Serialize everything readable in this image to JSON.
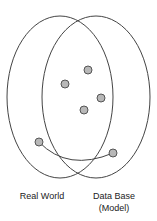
{
  "diagram": {
    "sets": [
      {
        "id": "real-world",
        "label": "Real World"
      },
      {
        "id": "data-base",
        "label": "Data Base",
        "sublabel": "(Model)"
      }
    ],
    "points": [
      {
        "x": 88,
        "y": 70
      },
      {
        "x": 65,
        "y": 84
      },
      {
        "x": 101,
        "y": 98
      },
      {
        "x": 84,
        "y": 110
      },
      {
        "x": 39,
        "y": 142
      },
      {
        "x": 113,
        "y": 153
      }
    ],
    "connector": {
      "from": 4,
      "to": 5
    },
    "colors": {
      "stroke": "#444444",
      "point_fill": "#b8b8b8",
      "point_stroke": "#555555",
      "text": "#222222"
    }
  }
}
